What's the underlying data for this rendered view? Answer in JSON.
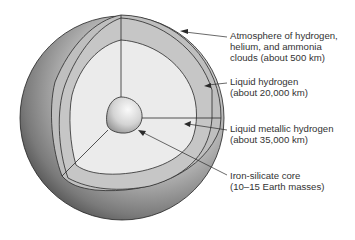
{
  "diagram": {
    "colors": {
      "outer_shell": "#bdbdbd",
      "atmosphere_band": "#c2c2c2",
      "liquid_hydrogen_band": "#c6c6c6",
      "metallic_region": "#ebebeb",
      "core": "#d8d8d8",
      "lines": "#2a2a2a",
      "text": "#333333"
    },
    "labels": [
      {
        "id": "atmosphere",
        "lines": [
          "Atmosphere of hydrogen,",
          "helium, and ammonia",
          "clouds (about 500 km)"
        ]
      },
      {
        "id": "liquid-hydrogen",
        "lines": [
          "Liquid hydrogen",
          "(about 20,000 km)"
        ]
      },
      {
        "id": "liquid-metallic-hydrogen",
        "lines": [
          "Liquid metallic hydrogen",
          "(about 35,000 km)"
        ]
      },
      {
        "id": "core",
        "lines": [
          "Iron-silicate core",
          "(10–15 Earth masses)"
        ]
      }
    ]
  }
}
